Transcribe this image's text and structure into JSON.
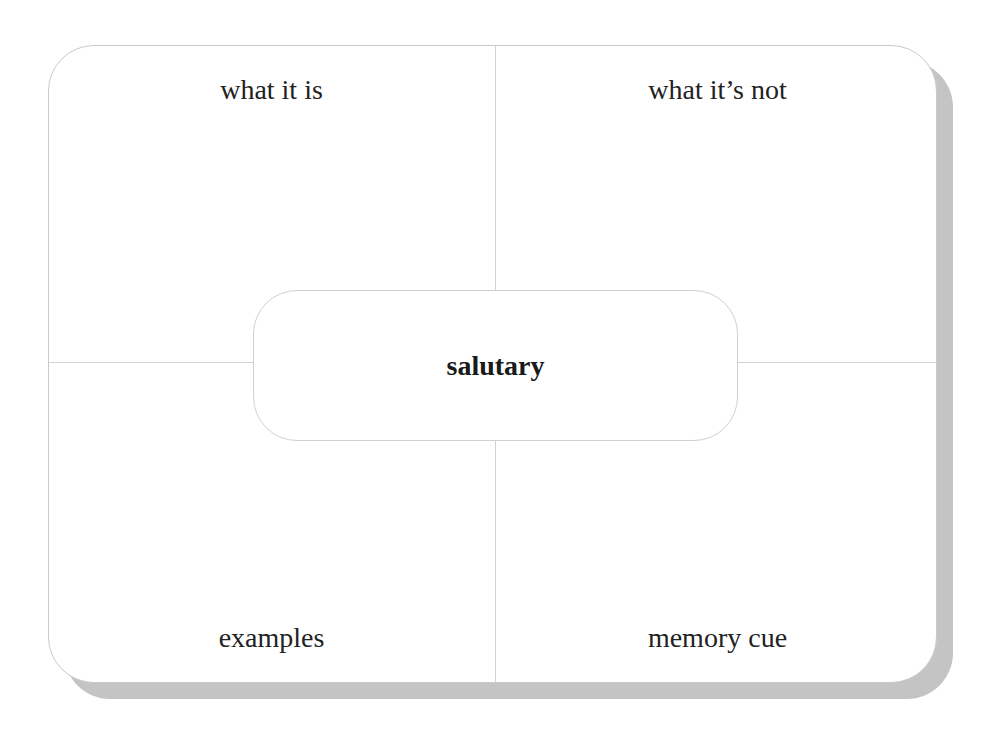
{
  "diagram": {
    "type": "frayer-model",
    "center_term": "salutary",
    "quadrants": {
      "top_left": "what it is",
      "top_right": "what it’s not",
      "bottom_left": "examples",
      "bottom_right": "memory cue"
    },
    "colors": {
      "card_border": "#c9c9c9",
      "divider": "#d2d2d2",
      "shadow": "#c4c4c4",
      "text": "#222222"
    }
  }
}
